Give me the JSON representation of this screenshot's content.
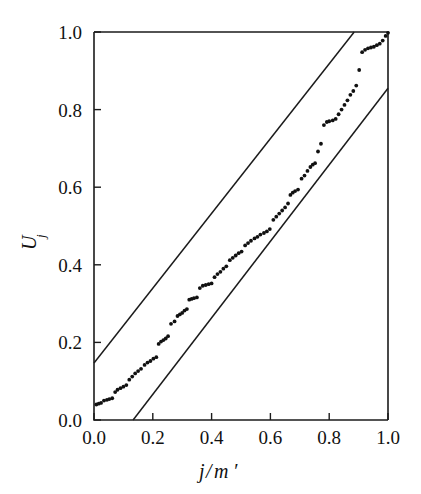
{
  "chart_data": {
    "type": "scatter",
    "title": "",
    "subtitle": "",
    "xlabel": "j/m'",
    "xlabel_parts": {
      "num": "j",
      "slash": "/",
      "den": "m",
      "prime": "′"
    },
    "ylabel": "U",
    "ylabel_sub": "j",
    "xlim": [
      0.0,
      1.0
    ],
    "ylim": [
      0.0,
      1.0
    ],
    "grid": false,
    "legend": null,
    "xticks": [
      0.0,
      0.2,
      0.4,
      0.6,
      0.8,
      1.0
    ],
    "xtick_labels": [
      "0.0",
      "0.2",
      "0.4",
      "0.6",
      "0.8",
      "1.0"
    ],
    "yticks": [
      0.0,
      0.2,
      0.4,
      0.6,
      0.8,
      1.0
    ],
    "ytick_labels": [
      "0.0",
      "0.2",
      "0.4",
      "0.6",
      "0.8",
      "1.0"
    ],
    "series": [
      {
        "name": "U_j samples",
        "type": "scatter",
        "marker": "dot",
        "color": "#111111",
        "points": [
          [
            0.008,
            0.04
          ],
          [
            0.016,
            0.042
          ],
          [
            0.024,
            0.044
          ],
          [
            0.034,
            0.05
          ],
          [
            0.044,
            0.052
          ],
          [
            0.052,
            0.054
          ],
          [
            0.062,
            0.056
          ],
          [
            0.072,
            0.072
          ],
          [
            0.08,
            0.078
          ],
          [
            0.09,
            0.082
          ],
          [
            0.1,
            0.086
          ],
          [
            0.11,
            0.09
          ],
          [
            0.12,
            0.104
          ],
          [
            0.13,
            0.112
          ],
          [
            0.14,
            0.12
          ],
          [
            0.15,
            0.126
          ],
          [
            0.16,
            0.132
          ],
          [
            0.172,
            0.142
          ],
          [
            0.182,
            0.148
          ],
          [
            0.192,
            0.152
          ],
          [
            0.202,
            0.158
          ],
          [
            0.212,
            0.162
          ],
          [
            0.22,
            0.196
          ],
          [
            0.228,
            0.202
          ],
          [
            0.236,
            0.206
          ],
          [
            0.244,
            0.21
          ],
          [
            0.252,
            0.216
          ],
          [
            0.262,
            0.248
          ],
          [
            0.274,
            0.254
          ],
          [
            0.284,
            0.268
          ],
          [
            0.292,
            0.272
          ],
          [
            0.3,
            0.276
          ],
          [
            0.308,
            0.282
          ],
          [
            0.316,
            0.286
          ],
          [
            0.324,
            0.31
          ],
          [
            0.332,
            0.312
          ],
          [
            0.34,
            0.314
          ],
          [
            0.35,
            0.316
          ],
          [
            0.36,
            0.34
          ],
          [
            0.37,
            0.346
          ],
          [
            0.38,
            0.348
          ],
          [
            0.39,
            0.35
          ],
          [
            0.4,
            0.352
          ],
          [
            0.41,
            0.368
          ],
          [
            0.42,
            0.376
          ],
          [
            0.43,
            0.382
          ],
          [
            0.44,
            0.39
          ],
          [
            0.45,
            0.396
          ],
          [
            0.462,
            0.412
          ],
          [
            0.472,
            0.418
          ],
          [
            0.482,
            0.424
          ],
          [
            0.492,
            0.43
          ],
          [
            0.502,
            0.434
          ],
          [
            0.514,
            0.45
          ],
          [
            0.524,
            0.456
          ],
          [
            0.534,
            0.462
          ],
          [
            0.546,
            0.468
          ],
          [
            0.556,
            0.472
          ],
          [
            0.566,
            0.478
          ],
          [
            0.578,
            0.482
          ],
          [
            0.588,
            0.486
          ],
          [
            0.598,
            0.492
          ],
          [
            0.61,
            0.516
          ],
          [
            0.62,
            0.524
          ],
          [
            0.63,
            0.532
          ],
          [
            0.64,
            0.54
          ],
          [
            0.65,
            0.548
          ],
          [
            0.66,
            0.558
          ],
          [
            0.668,
            0.58
          ],
          [
            0.676,
            0.586
          ],
          [
            0.684,
            0.59
          ],
          [
            0.694,
            0.594
          ],
          [
            0.706,
            0.622
          ],
          [
            0.716,
            0.63
          ],
          [
            0.726,
            0.642
          ],
          [
            0.736,
            0.652
          ],
          [
            0.744,
            0.658
          ],
          [
            0.752,
            0.662
          ],
          [
            0.762,
            0.692
          ],
          [
            0.772,
            0.712
          ],
          [
            0.782,
            0.76
          ],
          [
            0.792,
            0.768
          ],
          [
            0.8,
            0.77
          ],
          [
            0.812,
            0.772
          ],
          [
            0.822,
            0.776
          ],
          [
            0.832,
            0.788
          ],
          [
            0.842,
            0.8
          ],
          [
            0.852,
            0.812
          ],
          [
            0.862,
            0.824
          ],
          [
            0.872,
            0.838
          ],
          [
            0.882,
            0.848
          ],
          [
            0.892,
            0.862
          ],
          [
            0.902,
            0.902
          ],
          [
            0.912,
            0.948
          ],
          [
            0.922,
            0.954
          ],
          [
            0.932,
            0.958
          ],
          [
            0.942,
            0.96
          ],
          [
            0.952,
            0.962
          ],
          [
            0.962,
            0.966
          ],
          [
            0.972,
            0.97
          ],
          [
            0.982,
            0.978
          ],
          [
            0.992,
            0.99
          ],
          [
            1.0,
            0.998
          ]
        ]
      }
    ],
    "annotations": [
      {
        "name": "upper-bound-line",
        "type": "line",
        "x": [
          0.0,
          0.885
        ],
        "y": [
          0.147,
          1.0
        ],
        "color": "#1b1b1b"
      },
      {
        "name": "lower-bound-line",
        "type": "line",
        "x": [
          0.133,
          1.0
        ],
        "y": [
          0.0,
          0.855
        ],
        "color": "#1b1b1b"
      }
    ]
  }
}
